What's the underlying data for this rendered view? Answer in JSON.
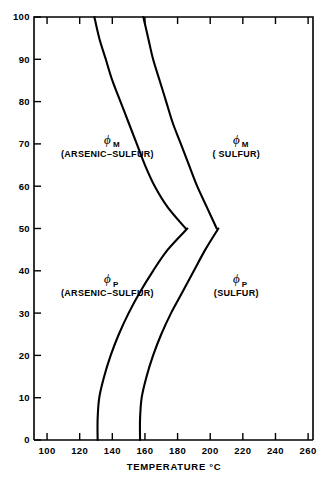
{
  "chart_data": {
    "type": "line",
    "title": "",
    "xlabel": "TEMPERATURE °C",
    "ylabel": "",
    "xlim": [
      92,
      263
    ],
    "ylim": [
      0,
      100
    ],
    "grid": false,
    "legend": "none",
    "xticks": [
      100,
      120,
      140,
      160,
      180,
      200,
      220,
      240,
      260
    ],
    "xtick_labels": [
      "100",
      "120",
      "140",
      "160",
      "180",
      "200",
      "220",
      "240",
      "260"
    ],
    "xminor_step": 20,
    "yticks": [
      0,
      10,
      20,
      30,
      40,
      50,
      60,
      70,
      80,
      90,
      100
    ],
    "ytick_labels": [
      "0",
      "10",
      "20",
      "30",
      "40",
      "50",
      "60",
      "70",
      "80",
      "90",
      "100"
    ],
    "line_color": "#000000",
    "line_width": 2.1,
    "series": [
      {
        "name": "phi_M (ARSENIC-SULFUR)",
        "points": [
          [
            129,
            100
          ],
          [
            132,
            95
          ],
          [
            136,
            90
          ],
          [
            140,
            85
          ],
          [
            145,
            80
          ],
          [
            150,
            75
          ],
          [
            155,
            70
          ],
          [
            160,
            65
          ],
          [
            166,
            60
          ],
          [
            174,
            55
          ],
          [
            185,
            50
          ]
        ]
      },
      {
        "name": "phi_M (SULFUR)",
        "points": [
          [
            159,
            100
          ],
          [
            162,
            95
          ],
          [
            165,
            90
          ],
          [
            169,
            85
          ],
          [
            173,
            80
          ],
          [
            177,
            75
          ],
          [
            182,
            70
          ],
          [
            187,
            65
          ],
          [
            192,
            60
          ],
          [
            198,
            55
          ],
          [
            204,
            50
          ]
        ]
      },
      {
        "name": "phi_P (ARSENIC-SULFUR)",
        "points": [
          [
            131,
            0
          ],
          [
            131,
            5
          ],
          [
            132,
            10
          ],
          [
            135,
            15
          ],
          [
            139,
            20
          ],
          [
            144,
            25
          ],
          [
            150,
            30
          ],
          [
            157,
            35
          ],
          [
            165,
            40
          ],
          [
            174,
            45
          ],
          [
            186,
            50
          ]
        ]
      },
      {
        "name": "phi_P (SULFUR)",
        "points": [
          [
            157,
            0
          ],
          [
            157,
            5
          ],
          [
            158,
            10
          ],
          [
            161,
            15
          ],
          [
            165,
            20
          ],
          [
            170,
            25
          ],
          [
            176,
            30
          ],
          [
            183,
            35
          ],
          [
            190,
            40
          ],
          [
            197,
            45
          ],
          [
            205,
            50
          ]
        ]
      }
    ],
    "annotations": [
      {
        "id": "phi-m-arsenic-sulfur",
        "symbol": "ϕ",
        "subscript": "M",
        "caption": "(ARSENIC–SULFUR)",
        "x": 137,
        "y": 70
      },
      {
        "id": "phi-m-sulfur",
        "symbol": "ϕ",
        "subscript": "M",
        "caption": "( SULFUR)",
        "x": 216,
        "y": 70
      },
      {
        "id": "phi-p-arsenic-sulfur",
        "symbol": "ϕ",
        "subscript": "P",
        "caption": "(ARSENIC–SULFUR)",
        "x": 137,
        "y": 37
      },
      {
        "id": "phi-p-sulfur",
        "symbol": "ϕ",
        "subscript": "P",
        "caption": "(SULFUR)",
        "x": 216,
        "y": 37
      }
    ]
  }
}
